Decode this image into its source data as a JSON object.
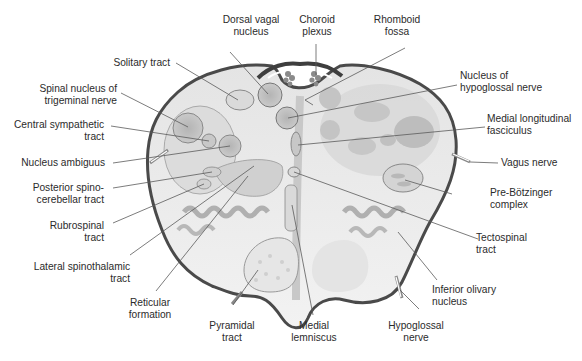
{
  "figure": {
    "colors": {
      "background": "#ffffff",
      "tissue_light": "#ebebeb",
      "tissue_mid": "#d6d6d6",
      "nucleus_fill": "#bdbdbd",
      "outline_dark": "#555555",
      "leader_line": "#555555",
      "label_text": "#2b2b2b"
    }
  },
  "labels": {
    "dorsal_vagal_nucleus": {
      "line1": "Dorsal vagal",
      "line2": "nucleus"
    },
    "choroid_plexus": {
      "line1": "Choroid",
      "line2": "plexus"
    },
    "rhomboid_fossa": {
      "line1": "Rhomboid",
      "line2": "fossa"
    },
    "solitary_tract": {
      "line1": "Solitary tract"
    },
    "spinal_nucleus_trigeminal": {
      "line1": "Spinal nucleus of",
      "line2": "trigeminal nerve"
    },
    "central_sympathetic_tract": {
      "line1": "Central sympathetic",
      "line2": "tract"
    },
    "nucleus_ambiguus": {
      "line1": "Nucleus ambiguus"
    },
    "posterior_spinocerebellar": {
      "line1": "Posterior spino-",
      "line2": "cerebellar tract"
    },
    "rubrospinal_tract": {
      "line1": "Rubrospinal",
      "line2": "tract"
    },
    "lateral_spinothalamic": {
      "line1": "Lateral spinothalamic",
      "line2": "tract"
    },
    "reticular_formation": {
      "line1": "Reticular",
      "line2": "formation"
    },
    "pyramidal_tract": {
      "line1": "Pyramidal",
      "line2": "tract"
    },
    "medial_lemniscus": {
      "line1": "Medial",
      "line2": "lemniscus"
    },
    "hypoglossal_nerve": {
      "line1": "Hypoglossal",
      "line2": "nerve"
    },
    "inferior_olivary_nucleus": {
      "line1": "Inferior olivary",
      "line2": "nucleus"
    },
    "tectospinal_tract": {
      "line1": "Tectospinal",
      "line2": "tract"
    },
    "pre_botzinger_complex": {
      "line1": "Pre-Bötzinger",
      "line2": "complex"
    },
    "vagus_nerve": {
      "line1": "Vagus nerve"
    },
    "medial_longitudinal_fasciculus": {
      "line1": "Medial longitudinal",
      "line2": "fasciculus"
    },
    "nucleus_hypoglossal_nerve": {
      "line1": "Nucleus of",
      "line2": "hypoglossal nerve"
    }
  }
}
